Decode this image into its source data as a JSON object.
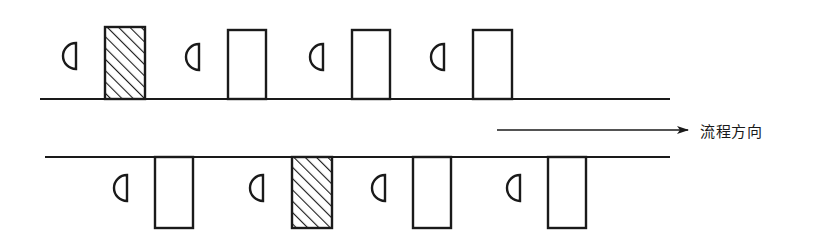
{
  "diagram": {
    "type": "process-flow-schematic",
    "canvas": {
      "width": 818,
      "height": 249
    },
    "background_color": "#ffffff",
    "stroke_color": "#1a1a1a",
    "hatch_color": "#1a1a1a",
    "fill_color": "#ffffff",
    "annotation": {
      "flow_direction_label": "流程方向",
      "arrow": {
        "name": "flow-direction-arrow",
        "x1": 497,
        "y1": 130,
        "x2": 688,
        "y2": 130,
        "head_length": 11,
        "head_width": 7
      },
      "label_position": {
        "x": 700,
        "y": 120
      }
    },
    "lines": [
      {
        "name": "upper-process-line",
        "x1": 40,
        "y1": 99,
        "x2": 670,
        "y2": 99,
        "stroke_width": 2.4
      },
      {
        "name": "lower-process-line",
        "x1": 45,
        "y1": 157,
        "x2": 670,
        "y2": 157,
        "stroke_width": 2.4
      }
    ],
    "upper_row": {
      "name": "upper-station-row",
      "orientation": "above-line",
      "baseline_y": 99,
      "stations": [
        {
          "index": 1,
          "name": "upper-station-1",
          "hatched": true,
          "marker": {
            "name": "half-disc-marker",
            "cx": 76,
            "cy": 56,
            "r": 13
          },
          "box": {
            "x": 105,
            "y": 27,
            "width": 40,
            "height": 72
          }
        },
        {
          "index": 2,
          "name": "upper-station-2",
          "hatched": false,
          "marker": {
            "name": "half-disc-marker",
            "cx": 199,
            "cy": 57,
            "r": 13
          },
          "box": {
            "x": 228,
            "y": 30,
            "width": 38,
            "height": 69
          }
        },
        {
          "index": 3,
          "name": "upper-station-3",
          "hatched": false,
          "marker": {
            "name": "half-disc-marker",
            "cx": 323,
            "cy": 57,
            "r": 13
          },
          "box": {
            "x": 352,
            "y": 30,
            "width": 38,
            "height": 69
          }
        },
        {
          "index": 4,
          "name": "upper-station-4",
          "hatched": false,
          "marker": {
            "name": "half-disc-marker",
            "cx": 444,
            "cy": 57,
            "r": 13
          },
          "box": {
            "x": 473,
            "y": 30,
            "width": 39,
            "height": 69
          }
        }
      ]
    },
    "lower_row": {
      "name": "lower-station-row",
      "orientation": "below-line",
      "baseline_y": 157,
      "stations": [
        {
          "index": 1,
          "name": "lower-station-1",
          "hatched": false,
          "marker": {
            "name": "half-disc-marker",
            "cx": 127,
            "cy": 188,
            "r": 13
          },
          "box": {
            "x": 155,
            "y": 157,
            "width": 38,
            "height": 71
          }
        },
        {
          "index": 2,
          "name": "lower-station-2",
          "hatched": true,
          "marker": {
            "name": "half-disc-marker",
            "cx": 263,
            "cy": 188,
            "r": 13
          },
          "box": {
            "x": 292,
            "y": 157,
            "width": 40,
            "height": 71
          }
        },
        {
          "index": 3,
          "name": "lower-station-3",
          "hatched": false,
          "marker": {
            "name": "half-disc-marker",
            "cx": 385,
            "cy": 188,
            "r": 13
          },
          "box": {
            "x": 413,
            "y": 157,
            "width": 38,
            "height": 71
          }
        },
        {
          "index": 4,
          "name": "lower-station-4",
          "hatched": false,
          "marker": {
            "name": "half-disc-marker",
            "cx": 520,
            "cy": 188,
            "r": 13
          },
          "box": {
            "x": 548,
            "y": 157,
            "width": 38,
            "height": 71
          }
        }
      ]
    }
  }
}
